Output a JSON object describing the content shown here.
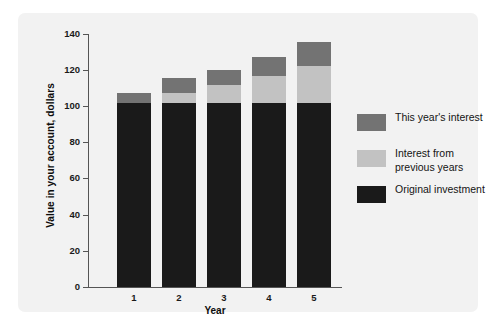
{
  "chart_data": {
    "type": "bar",
    "subtype": "stacked",
    "title": "",
    "xlabel": "Year",
    "ylabel": "Value in your account, dollars",
    "categories": [
      "1",
      "2",
      "3",
      "4",
      "5"
    ],
    "series": [
      {
        "name": "Original investment",
        "color": "#1a1a1a",
        "values": [
          102,
          102,
          102,
          102,
          102
        ]
      },
      {
        "name": "Interest from previous years",
        "color": "#c2c2c2",
        "values": [
          0,
          5.5,
          10,
          15,
          20.5
        ]
      },
      {
        "name": "This year's interest",
        "color": "#737373",
        "values": [
          5.5,
          8,
          8,
          10.5,
          13
        ]
      }
    ],
    "totals": [
      107.5,
      115.5,
      120,
      127.5,
      135.5
    ],
    "ylim": [
      0,
      140
    ],
    "yticks": [
      0,
      20,
      40,
      60,
      80,
      100,
      120,
      140
    ],
    "ytick_labels": [
      "0",
      "20",
      "40",
      "60",
      "80",
      "100",
      "120",
      "140"
    ],
    "grid": false,
    "legend_position": "right"
  },
  "legend": {
    "entries": [
      {
        "label": "This year's interest",
        "color": "#737373",
        "swatch_name": "legend-swatch-this-year"
      },
      {
        "label": "Interest from previous years",
        "color": "#c2c2c2",
        "swatch_name": "legend-swatch-previous-years"
      },
      {
        "label": "Original investment",
        "color": "#1a1a1a",
        "swatch_name": "legend-swatch-original"
      }
    ]
  },
  "axes": {
    "y_title": "Value in your account, dollars",
    "x_title": "Year",
    "y_ticks": [
      "0",
      "20",
      "40",
      "60",
      "80",
      "100",
      "120",
      "140"
    ],
    "x_ticks": [
      "1",
      "2",
      "3",
      "4",
      "5"
    ]
  },
  "colors": {
    "panel_background": "#f2f2f2",
    "figure_background": "#ffffff",
    "axis": "#555555",
    "text": "#1a1a1a",
    "original_investment": "#1a1a1a",
    "previous_interest": "#c2c2c2",
    "this_year_interest": "#737373"
  }
}
